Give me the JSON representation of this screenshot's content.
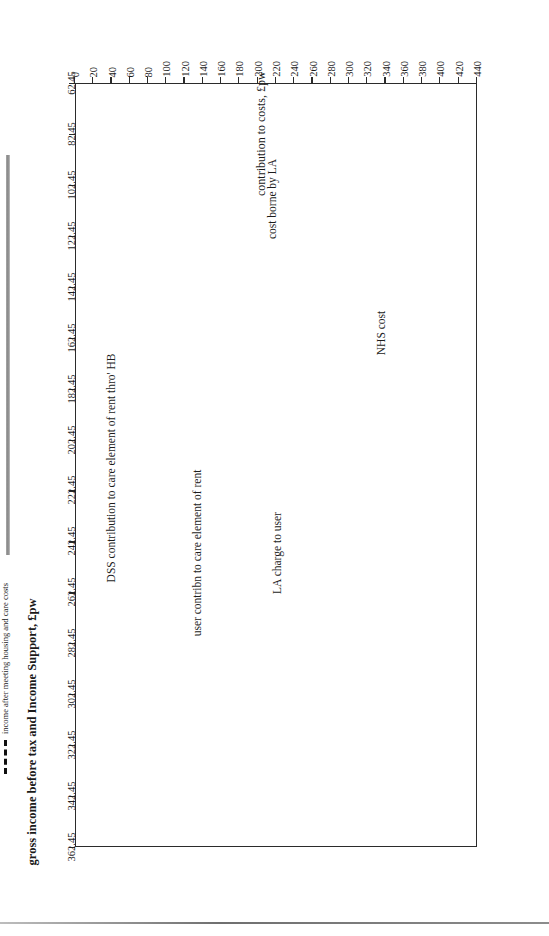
{
  "chart_data": {
    "type": "area",
    "title": "",
    "xlabel": "gross income before tax and Income Support, £pw",
    "ylabel": "contribution to costs, £pw",
    "xlim": [
      62.45,
      362.45
    ],
    "ylim": [
      0,
      440
    ],
    "grid": false,
    "legend_position": "below-axis-right",
    "x_ticks": [
      "62.45",
      "82.45",
      "102.45",
      "122.45",
      "142.45",
      "162.45",
      "182.45",
      "202.45",
      "222.45",
      "242.45",
      "262.45",
      "282.45",
      "302.45",
      "322.45",
      "342.45",
      "362.45"
    ],
    "y_ticks": [
      "0",
      "20",
      "40",
      "60",
      "80",
      "100",
      "120",
      "140",
      "160",
      "180",
      "200",
      "220",
      "240",
      "260",
      "280",
      "300",
      "320",
      "340",
      "360",
      "380",
      "400",
      "420",
      "440"
    ],
    "x": [
      62.45,
      182.45,
      362.45
    ],
    "series": [
      {
        "name": "DSS contribution to care element of rent thro' HB",
        "label": "DSS contribution to care element of rent thro' HB",
        "fill": "#d4d4d4",
        "upper_values": [
          176,
          176,
          0
        ],
        "lower_values": [
          0,
          0,
          0
        ]
      },
      {
        "name": "user contribn to care element of rent",
        "label": "user contribn to care element of rent",
        "fill": "#ffffff",
        "upper_values": [
          176,
          176,
          258
        ],
        "lower_values": [
          176,
          176,
          0
        ]
      },
      {
        "name": "LA charge to user",
        "label": "LA charge to user",
        "fill": "#d4d4d4",
        "upper_values": [
          258,
          258,
          258
        ],
        "lower_values": [
          176,
          176,
          258
        ]
      },
      {
        "name": "cost borne by LA",
        "label": "cost borne by LA",
        "fill": "#ffffff",
        "upper_values": [
          258,
          258,
          258
        ],
        "lower_values": [
          258,
          258,
          258
        ]
      },
      {
        "name": "NHS cost",
        "label": "NHS cost",
        "fill": "#ffffff",
        "upper_values": [
          431,
          431,
          431
        ],
        "lower_values": [
          258,
          258,
          258
        ]
      }
    ],
    "reference_line": {
      "name": "income after meeting housing and care costs",
      "style": "dashed",
      "color": "#101010",
      "value": 77
    },
    "legend": [
      {
        "label": "income after meeting housing and care costs",
        "style": "dashed"
      }
    ],
    "band_labels": [
      "NHS cost",
      "cost borne by LA",
      "LA charge to user",
      "user contribn to care element of rent",
      "DSS contribution to care element of rent thro' HB"
    ]
  },
  "axes": {
    "x_title": "gross income before tax and Income Support, £pw",
    "y_title": "contribution to costs, £pw"
  },
  "labels": {
    "nhs_cost": "NHS cost",
    "cost_borne_by_la": "cost borne by LA",
    "la_charge_to_user": "LA charge to user",
    "user_contribn": "user contribn to care element of rent",
    "dss_contribution": "DSS contribution to care element of rent thro' HB"
  },
  "legend": {
    "income_after": "income after meeting housing and care costs"
  },
  "colors": {
    "band_gray": "#d4d4d4",
    "band_white": "#ffffff",
    "line": "#2b2b2b",
    "dashed": "#101010",
    "text": "#1c1c1c"
  },
  "x_ticks": [
    "62.45",
    "82.45",
    "102.45",
    "122.45",
    "142.45",
    "162.45",
    "182.45",
    "202.45",
    "222.45",
    "242.45",
    "262.45",
    "282.45",
    "302.45",
    "322.45",
    "342.45",
    "362.45"
  ],
  "y_ticks": [
    "440",
    "420",
    "400",
    "380",
    "360",
    "340",
    "320",
    "300",
    "280",
    "260",
    "240",
    "220",
    "200",
    "180",
    "160",
    "140",
    "120",
    "100",
    "80",
    "60",
    "40",
    "20",
    "0"
  ]
}
